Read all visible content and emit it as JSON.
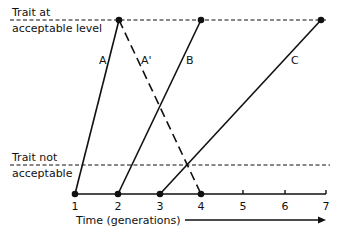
{
  "diagram": {
    "top_label_line1": "Trait at",
    "top_label_line2": "acceptable level",
    "threshold_label_line1": "Trait not",
    "threshold_label_line2": "acceptable",
    "x_axis_label": "Time (generations)",
    "x_ticks": [
      "1",
      "2",
      "3",
      "4",
      "5",
      "6",
      "7"
    ],
    "lines": [
      {
        "name": "A",
        "label": "A",
        "style": "solid",
        "from_generation": 1,
        "to_generation": 2,
        "direction": "rising"
      },
      {
        "name": "A'",
        "label": "A'",
        "style": "dashed",
        "from_generation": 2,
        "to_generation": 4,
        "direction": "falling"
      },
      {
        "name": "B",
        "label": "B",
        "style": "solid",
        "from_generation": 2,
        "to_generation": 4,
        "direction": "rising"
      },
      {
        "name": "C",
        "label": "C",
        "style": "solid",
        "from_generation": 3,
        "to_generation": 7,
        "direction": "rising"
      }
    ],
    "colors": {
      "ink": "#111111",
      "background": "#ffffff"
    }
  }
}
